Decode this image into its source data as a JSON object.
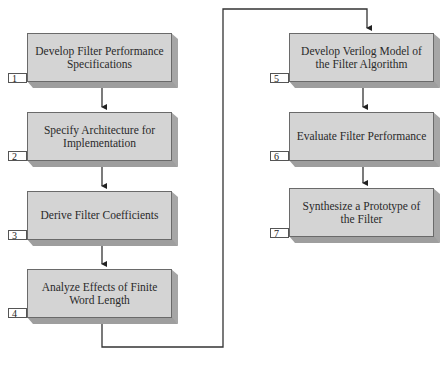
{
  "diagram": {
    "type": "flowchart",
    "steps": [
      {
        "number": "1",
        "label": "Develop Filter Performance Specifications"
      },
      {
        "number": "2",
        "label": "Specify Architecture for Implementation"
      },
      {
        "number": "3",
        "label": "Derive Filter Coefficients"
      },
      {
        "number": "4",
        "label": "Analyze Effects of Finite Word Length"
      },
      {
        "number": "5",
        "label": "Develop Verilog Model of the Filter Algorithm"
      },
      {
        "number": "6",
        "label": "Evaluate Filter Performance"
      },
      {
        "number": "7",
        "label": "Synthesize a Prototype of the Filter"
      }
    ],
    "edges": [
      {
        "from": "1",
        "to": "2"
      },
      {
        "from": "2",
        "to": "3"
      },
      {
        "from": "3",
        "to": "4"
      },
      {
        "from": "4",
        "to": "5"
      },
      {
        "from": "5",
        "to": "6"
      },
      {
        "from": "6",
        "to": "7"
      }
    ],
    "colors": {
      "box_face": "#d4d4d4",
      "box_side": "#a6a6a6",
      "outline": "#555555",
      "background": "#ffffff"
    }
  }
}
